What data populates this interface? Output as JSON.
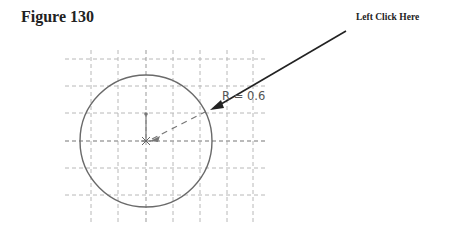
{
  "figure": {
    "title": "Figure 130",
    "callout_text": "Left Click Here",
    "dimension_label": "R = 0.6"
  },
  "drawing": {
    "grid": {
      "x_lines": [
        91,
        118,
        146,
        173,
        200,
        227,
        253
      ],
      "y_lines": [
        59,
        86,
        113,
        141,
        168,
        195
      ],
      "color": "#b0b0b0"
    },
    "circle": {
      "cx": 146,
      "cy": 141,
      "r": 66,
      "color": "#666666"
    },
    "radius_value": 0.6
  }
}
